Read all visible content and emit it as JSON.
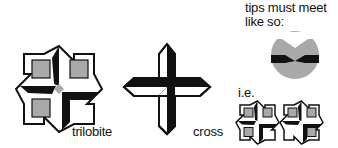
{
  "labels": {
    "trilobite": "trilobite",
    "cross": "cross",
    "tips_line1": "tips must meet",
    "tips_line2": "like so:",
    "ie": "i.e."
  },
  "colors": {
    "black": "#111111",
    "gray": "#a9a9a9",
    "white": "#ffffff"
  }
}
